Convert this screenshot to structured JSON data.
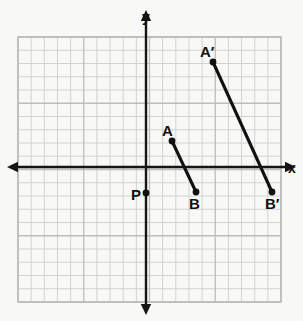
{
  "figure": {
    "background_color": "#f8f8f6",
    "ink_color": "#111111",
    "grid_color": "#d2d2d2",
    "grid_major_color": "#bdbdbd"
  },
  "axes": {
    "x_axis": {
      "label": "x",
      "label_x": 288,
      "label_y": 173,
      "y": 167,
      "x_start": 7,
      "x_end": 296,
      "arrow_left": true,
      "arrow_right": true
    },
    "y_axis": {
      "label": "y",
      "label_x": 146,
      "label_y": 22,
      "x": 146,
      "y_start": 10,
      "y_end": 315,
      "arrow_up": true,
      "arrow_down": true
    }
  },
  "grid": {
    "left": 18,
    "top": 37,
    "right": 281,
    "bottom": 302,
    "cols": 20,
    "rows": 20,
    "cell_size": 13.15,
    "major_every": 5
  },
  "points": [
    {
      "id": "A",
      "label": "A",
      "x": 172,
      "y": 141,
      "label_x": 162,
      "label_y": 136,
      "dot": true
    },
    {
      "id": "B",
      "label": "B",
      "x": 196,
      "y": 192,
      "label_x": 189,
      "label_y": 209,
      "dot": true
    },
    {
      "id": "A_prime",
      "label": "A′",
      "x": 213,
      "y": 62,
      "label_x": 200,
      "label_y": 57,
      "dot": true
    },
    {
      "id": "B_prime",
      "label": "B′",
      "x": 272,
      "y": 192,
      "label_x": 265,
      "label_y": 209,
      "dot": true
    },
    {
      "id": "P",
      "label": "P",
      "x": 146,
      "y": 193,
      "label_x": 131,
      "label_y": 200,
      "dot": true
    }
  ],
  "segments": [
    {
      "id": "AB",
      "from": "A",
      "to": "B",
      "x1": 172,
      "y1": 141,
      "x2": 196,
      "y2": 192
    },
    {
      "id": "A_prime_B_prime",
      "from": "A′",
      "to": "B′",
      "x1": 213,
      "y1": 62,
      "x2": 272,
      "y2": 192
    }
  ],
  "chart_data": {
    "type": "scatter",
    "xlabel": "x",
    "ylabel": "y",
    "grid": true,
    "legend": "none",
    "axis_origin_px": {
      "x": 146,
      "y": 167
    },
    "pixels_per_unit": 13.15,
    "xlim": [
      -9.7,
      10.3
    ],
    "ylim": [
      -10.3,
      9.9
    ],
    "points": [
      {
        "label": "A",
        "x": 2,
        "y": 2
      },
      {
        "label": "B",
        "x": 4,
        "y": -2
      },
      {
        "label": "A′",
        "x": 5,
        "y": 8
      },
      {
        "label": "B′",
        "x": 9.6,
        "y": -2
      },
      {
        "label": "P",
        "x": 0,
        "y": -2
      }
    ],
    "segments": [
      {
        "name": "AB",
        "endpoints": [
          "A",
          "B"
        ]
      },
      {
        "name": "A′B′",
        "endpoints": [
          "A′",
          "B′"
        ]
      }
    ]
  }
}
